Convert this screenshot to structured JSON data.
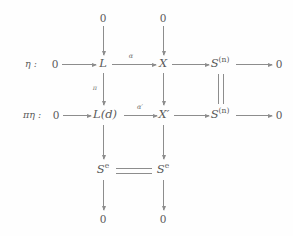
{
  "diagram": {
    "type": "commutative-diagram",
    "row_labels": [
      {
        "id": "eta",
        "text": "η :"
      },
      {
        "id": "pi-eta",
        "text": "πη :"
      }
    ],
    "zeros": {
      "top_left": "0",
      "top_right": "0",
      "row1_start": "0",
      "row1_end": "0",
      "row2_start": "0",
      "row2_end": "0",
      "bottom_left": "0",
      "bottom_right": "0"
    },
    "objects": {
      "row1_col1": "L",
      "row1_col2": "X",
      "row1_col3_base": "S",
      "row1_col3_sup": "(n)",
      "row2_col1": "L(d)",
      "row2_col2": "X′",
      "row2_col3_base": "S",
      "row2_col3_sup": "(n)",
      "row3_col1_base": "S",
      "row3_col1_sup": "e",
      "row3_col2_base": "S",
      "row3_col2_sup": "e"
    },
    "arrow_labels": {
      "alpha": "α",
      "alpha_prime": "α′",
      "pi": "π"
    },
    "equalities": [
      {
        "id": "sn-equality",
        "orientation": "vertical",
        "between": [
          "row1_col3",
          "row2_col3"
        ]
      },
      {
        "id": "se-equality",
        "orientation": "horizontal",
        "between": [
          "row3_col1",
          "row3_col2"
        ]
      }
    ],
    "colors": {
      "ink": "#5a5a5a",
      "rule": "#8d8d8d",
      "background": "#fefefe"
    }
  }
}
